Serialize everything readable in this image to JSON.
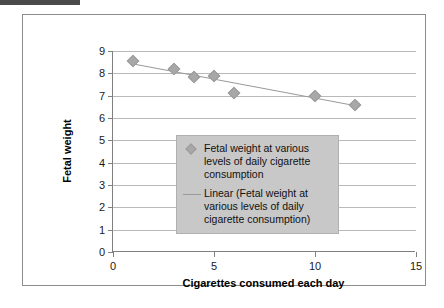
{
  "decor": {
    "top_rule_color": "#4a4a4a"
  },
  "chart_data": {
    "type": "scatter",
    "title": "",
    "xlabel": "Cigarettes consumed each day",
    "ylabel": "Fetal weight",
    "xlim": [
      0,
      15
    ],
    "ylim": [
      0,
      9
    ],
    "xticks": [
      0,
      5,
      10,
      15
    ],
    "yticks": [
      0,
      1,
      2,
      3,
      4,
      5,
      6,
      7,
      8,
      9
    ],
    "xtick_labels": [
      "0",
      "5",
      "10",
      "15"
    ],
    "ytick_labels": [
      "0",
      "1",
      "2",
      "3",
      "4",
      "5",
      "6",
      "7",
      "8",
      "9"
    ],
    "grid": "horizontal",
    "legend_position": "center",
    "series": [
      {
        "name": "Fetal weight at various levels of daily cigarette consumption",
        "type": "scatter",
        "marker": "diamond",
        "color": "#a8a8a8",
        "x": [
          1,
          3,
          4,
          5,
          6,
          10,
          12
        ],
        "y": [
          8.55,
          8.2,
          7.85,
          7.9,
          7.1,
          7.0,
          6.6
        ]
      },
      {
        "name": "Linear (Fetal weight at various levels of daily cigarette consumption)",
        "type": "line",
        "color": "#999999",
        "x": [
          1,
          12
        ],
        "y": [
          8.42,
          6.55
        ]
      }
    ]
  },
  "legend": {
    "entries": [
      {
        "key": "diamond-marker",
        "label": "Fetal weight at various levels of daily cigarette consumption"
      },
      {
        "key": "trend-line",
        "label": "Linear (Fetal weight at various levels of daily cigarette consumption)"
      }
    ]
  }
}
